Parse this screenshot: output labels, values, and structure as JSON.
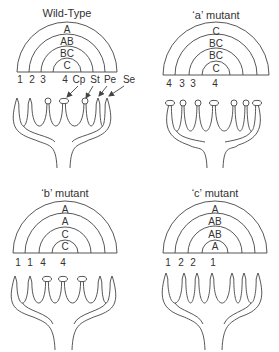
{
  "figure": {
    "colors": {
      "line": "#444444",
      "text": "#333333",
      "background": "#ffffff"
    },
    "panels": [
      {
        "id": "wild-type",
        "title": "Wild-Type",
        "whorl_genes_outer_to_inner": [
          "A",
          "AB",
          "BC",
          "C"
        ],
        "whorl_organ_numbers": [
          "1",
          "2",
          "3",
          "4"
        ],
        "organ_labels": [
          "Cp",
          "St",
          "Pe",
          "Se"
        ],
        "flower_organs": [
          "sepal",
          "petal",
          "stamen",
          "carpel",
          "stamen",
          "petal",
          "sepal"
        ]
      },
      {
        "id": "a-mutant",
        "title": "‘a’ mutant",
        "whorl_genes_outer_to_inner": [
          "C",
          "BC",
          "BC",
          "C"
        ],
        "whorl_organ_numbers": [
          "4",
          "3",
          "3",
          "4"
        ],
        "flower_organs": [
          "carpel",
          "stamen",
          "stamen",
          "carpel",
          "stamen",
          "stamen",
          "carpel"
        ]
      },
      {
        "id": "b-mutant",
        "title": "‘b’ mutant",
        "whorl_genes_outer_to_inner": [
          "A",
          "A",
          "C",
          "C"
        ],
        "whorl_organ_numbers": [
          "1",
          "1",
          "4",
          "4"
        ],
        "flower_organs": [
          "sepal",
          "sepal",
          "carpel",
          "carpel",
          "carpel",
          "sepal",
          "sepal"
        ]
      },
      {
        "id": "c-mutant",
        "title": "‘c’ mutant",
        "whorl_genes_outer_to_inner": [
          "A",
          "AB",
          "AB",
          "A"
        ],
        "whorl_organ_numbers": [
          "1",
          "2",
          "2",
          "1"
        ],
        "flower_organs": [
          "sepal",
          "petal",
          "petal",
          "sepal",
          "petal",
          "petal",
          "sepal"
        ]
      }
    ]
  }
}
